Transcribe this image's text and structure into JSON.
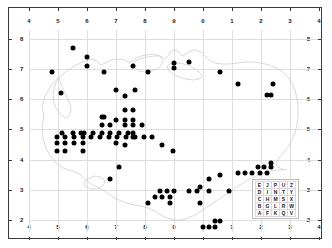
{
  "figure": {
    "kind": "distribution-dot-map",
    "background_color": "#ffffff",
    "frame_color": "#3a3a3a",
    "grid_color": "#dedede",
    "coastline_color": "#c9c9c9",
    "dot_color": "#000000"
  },
  "axes": {
    "top_labels": [
      "4",
      "5",
      "6",
      "7",
      "8",
      "9",
      "0",
      "1",
      "2",
      "3",
      "4"
    ],
    "bottom_labels": [
      "4",
      "5",
      "6",
      "7",
      "8",
      "9",
      "0",
      "1",
      "2",
      "3",
      "4"
    ],
    "left_labels": [
      "8",
      "7",
      "6",
      "5",
      "4",
      "3",
      "2"
    ],
    "right_labels": [
      "8",
      "7",
      "6",
      "5",
      "4",
      "3",
      "2"
    ]
  },
  "legend": {
    "name": "grid-letter-key",
    "rows": [
      [
        "E",
        "J",
        "P",
        "U",
        "Z"
      ],
      [
        "D",
        "I",
        "N",
        "T",
        "Y"
      ],
      [
        "C",
        "H",
        "M",
        "S",
        "X"
      ],
      [
        "B",
        "G",
        "L",
        "R",
        "W"
      ],
      [
        "A",
        "F",
        "K",
        "Q",
        "V"
      ]
    ]
  },
  "chart_data": {
    "type": "scatter",
    "title": "",
    "xlabel": "",
    "ylabel": "",
    "xlim": [
      4.0,
      14.0
    ],
    "ylim": [
      1.6,
      8.3
    ],
    "grid": true,
    "legend_position": "bottom-right",
    "x_tick_values": [
      4,
      5,
      6,
      7,
      8,
      9,
      10,
      11,
      12,
      13,
      14
    ],
    "x_tick_labels": [
      "4",
      "5",
      "6",
      "7",
      "8",
      "9",
      "0",
      "1",
      "2",
      "3",
      "4"
    ],
    "y_tick_values": [
      8,
      7,
      6,
      5,
      4,
      3,
      2
    ],
    "y_tick_labels": [
      "8",
      "7",
      "6",
      "5",
      "4",
      "3",
      "2"
    ],
    "point_count": 124,
    "points": [
      [
        5.5,
        7.7
      ],
      [
        6.0,
        7.4
      ],
      [
        6.0,
        7.1
      ],
      [
        4.8,
        6.9
      ],
      [
        6.6,
        6.9
      ],
      [
        9.0,
        7.2
      ],
      [
        9.0,
        7.05
      ],
      [
        9.5,
        7.25
      ],
      [
        7.6,
        7.1
      ],
      [
        8.1,
        6.9
      ],
      [
        10.6,
        6.9
      ],
      [
        5.1,
        6.2
      ],
      [
        7.0,
        6.3
      ],
      [
        7.65,
        6.3
      ],
      [
        7.3,
        6.1
      ],
      [
        11.2,
        6.5
      ],
      [
        12.4,
        6.5
      ],
      [
        12.2,
        6.15
      ],
      [
        12.35,
        6.15
      ],
      [
        7.3,
        5.65
      ],
      [
        7.6,
        5.65
      ],
      [
        6.5,
        5.4
      ],
      [
        7.0,
        5.3
      ],
      [
        7.3,
        5.3
      ],
      [
        7.6,
        5.3
      ],
      [
        6.5,
        5.15
      ],
      [
        7.3,
        5.15
      ],
      [
        7.6,
        5.15
      ],
      [
        7.9,
        5.15
      ],
      [
        5.15,
        4.9
      ],
      [
        6.5,
        4.9
      ],
      [
        6.8,
        4.9
      ],
      [
        7.1,
        4.9
      ],
      [
        7.4,
        4.9
      ],
      [
        7.6,
        4.9
      ],
      [
        4.95,
        4.75
      ],
      [
        5.25,
        4.75
      ],
      [
        5.55,
        4.75
      ],
      [
        5.85,
        4.75
      ],
      [
        6.15,
        4.75
      ],
      [
        6.45,
        4.75
      ],
      [
        6.75,
        4.75
      ],
      [
        7.05,
        4.75
      ],
      [
        7.35,
        4.75
      ],
      [
        7.65,
        4.75
      ],
      [
        7.95,
        4.75
      ],
      [
        8.25,
        4.75
      ],
      [
        4.95,
        4.55
      ],
      [
        5.25,
        4.55
      ],
      [
        5.55,
        4.55
      ],
      [
        5.85,
        4.55
      ],
      [
        7.3,
        4.5
      ],
      [
        8.6,
        4.5
      ],
      [
        4.95,
        4.3
      ],
      [
        5.25,
        4.3
      ],
      [
        5.85,
        4.3
      ],
      [
        8.95,
        4.3
      ],
      [
        7.1,
        3.75
      ],
      [
        12.35,
        3.9
      ],
      [
        11.9,
        3.75
      ],
      [
        12.1,
        3.75
      ],
      [
        12.35,
        3.75
      ],
      [
        11.2,
        3.55
      ],
      [
        11.45,
        3.55
      ],
      [
        11.7,
        3.55
      ],
      [
        11.95,
        3.55
      ],
      [
        12.2,
        3.55
      ],
      [
        10.6,
        3.5
      ],
      [
        6.8,
        3.35
      ],
      [
        10.2,
        3.35
      ],
      [
        9.9,
        3.1
      ],
      [
        8.5,
        2.95
      ],
      [
        8.75,
        2.95
      ],
      [
        9.0,
        2.95
      ],
      [
        9.5,
        2.95
      ],
      [
        9.8,
        2.95
      ],
      [
        10.2,
        2.95
      ],
      [
        10.9,
        2.95
      ],
      [
        8.35,
        2.75
      ],
      [
        8.6,
        2.75
      ],
      [
        8.85,
        2.75
      ],
      [
        8.1,
        2.55
      ],
      [
        8.85,
        2.55
      ],
      [
        9.9,
        2.55
      ],
      [
        10.4,
        1.95
      ],
      [
        10.6,
        1.95
      ],
      [
        10.0,
        1.78
      ],
      [
        10.2,
        1.78
      ],
      [
        10.4,
        1.78
      ],
      [
        7.6,
        4.75
      ],
      [
        6.2,
        4.9
      ],
      [
        5.9,
        4.9
      ],
      [
        6.8,
        5.15
      ],
      [
        7.0,
        4.55
      ],
      [
        6.6,
        5.4
      ],
      [
        5.5,
        4.9
      ],
      [
        5.8,
        4.9
      ]
    ]
  }
}
